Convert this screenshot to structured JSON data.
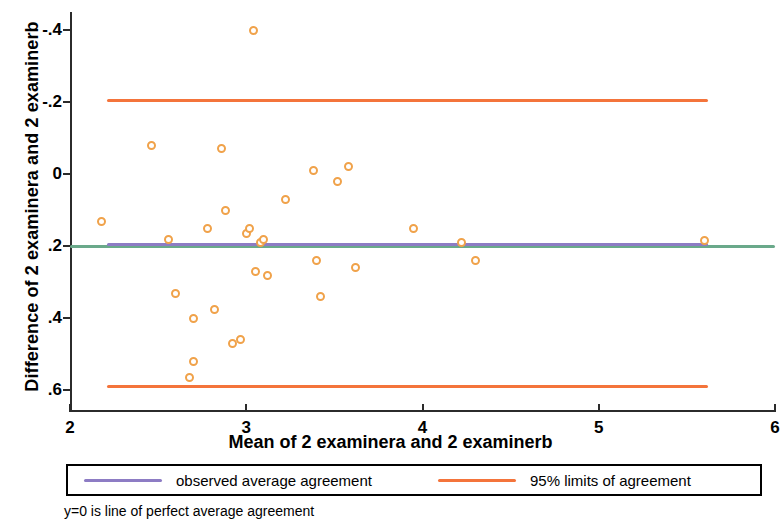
{
  "axes": {
    "ytitle": "Difference of 2 examinera and 2 examinerb",
    "xtitle": "Mean of 2 examinera and 2 examinerb",
    "yticks": [
      ".6",
      ".4",
      ".2",
      "0",
      "-.2",
      "-.4"
    ],
    "xticks": [
      "2",
      "3",
      "4",
      "5",
      "6"
    ]
  },
  "legend": {
    "observed_label": "observed average agreement",
    "limits_label": "95% limits of agreement",
    "observed_color": "#8d7cc4",
    "limits_color": "#f4743b"
  },
  "footnote": "y=0 is line of perfect average agreement",
  "colors": {
    "marker": "#f0a24a",
    "zero_line": "#6aa98a",
    "observed": "#8d7cc4",
    "limits": "#f4743b",
    "axis": "#2b2b2b"
  },
  "chart_data": {
    "type": "scatter",
    "title": "",
    "xlabel": "Mean of 2 examinera and 2 examinerb",
    "ylabel": "Difference of 2 examinera and 2 examinerb",
    "xlim": [
      2,
      6
    ],
    "ylim": [
      -0.46,
      0.65
    ],
    "xticks": [
      2,
      3,
      4,
      5,
      6
    ],
    "yticks": [
      -0.4,
      -0.2,
      0,
      0.2,
      0.4,
      0.6
    ],
    "grid": false,
    "legend_position": "below-axes",
    "annotation": "y=0 is line of perfect average agreement",
    "series": [
      {
        "name": "subjects",
        "marker": "open-circle",
        "color": "#f0a24a",
        "points": [
          {
            "x": 2.18,
            "y": 0.07
          },
          {
            "x": 2.46,
            "y": 0.28
          },
          {
            "x": 2.56,
            "y": 0.02
          },
          {
            "x": 2.6,
            "y": -0.13
          },
          {
            "x": 2.68,
            "y": -0.365
          },
          {
            "x": 2.7,
            "y": -0.2
          },
          {
            "x": 2.7,
            "y": -0.32
          },
          {
            "x": 2.78,
            "y": 0.05
          },
          {
            "x": 2.82,
            "y": -0.175
          },
          {
            "x": 2.86,
            "y": 0.27
          },
          {
            "x": 2.88,
            "y": 0.1
          },
          {
            "x": 2.92,
            "y": -0.27
          },
          {
            "x": 2.97,
            "y": -0.26
          },
          {
            "x": 3.0,
            "y": 0.035
          },
          {
            "x": 3.02,
            "y": 0.05
          },
          {
            "x": 3.04,
            "y": 0.6
          },
          {
            "x": 3.05,
            "y": -0.07
          },
          {
            "x": 3.08,
            "y": 0.01
          },
          {
            "x": 3.1,
            "y": 0.02
          },
          {
            "x": 3.12,
            "y": -0.08
          },
          {
            "x": 3.22,
            "y": 0.13
          },
          {
            "x": 3.38,
            "y": 0.21
          },
          {
            "x": 3.4,
            "y": -0.04
          },
          {
            "x": 3.42,
            "y": -0.14
          },
          {
            "x": 3.52,
            "y": 0.18
          },
          {
            "x": 3.58,
            "y": 0.22
          },
          {
            "x": 3.62,
            "y": -0.06
          },
          {
            "x": 3.95,
            "y": 0.05
          },
          {
            "x": 4.22,
            "y": 0.01
          },
          {
            "x": 4.3,
            "y": -0.04
          },
          {
            "x": 5.6,
            "y": 0.015
          }
        ]
      }
    ],
    "reference_lines": [
      {
        "name": "perfect average agreement",
        "y": 0.0,
        "color": "#6aa98a",
        "x_from": 2.0,
        "x_to": 6.0
      },
      {
        "name": "observed average agreement",
        "y": 0.005,
        "color": "#8d7cc4",
        "x_from": 2.21,
        "x_to": 5.62
      },
      {
        "name": "upper 95% limit of agreement",
        "y": 0.405,
        "color": "#f4743b",
        "x_from": 2.21,
        "x_to": 5.62
      },
      {
        "name": "lower 95% limit of agreement",
        "y": -0.39,
        "color": "#f4743b",
        "x_from": 2.21,
        "x_to": 5.62
      }
    ]
  }
}
